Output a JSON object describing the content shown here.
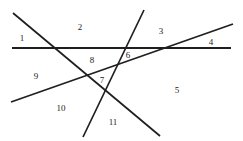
{
  "figure": {
    "width": 243,
    "height": 141,
    "background_color": "#ffffff",
    "stroke_color": "#1f1f1f"
  },
  "lines": [
    {
      "name": "horizontal-line",
      "x1": 12,
      "y1": 48,
      "x2": 231,
      "y2": 48,
      "stroke_width": 1.9
    },
    {
      "name": "descending-line",
      "x1": 13,
      "y1": 13,
      "x2": 160,
      "y2": 136,
      "stroke_width": 1.7
    },
    {
      "name": "ascending-line",
      "x1": 11,
      "y1": 102,
      "x2": 233,
      "y2": 24,
      "stroke_width": 1.7
    },
    {
      "name": "steep-line",
      "x1": 144,
      "y1": 10,
      "x2": 83,
      "y2": 137,
      "stroke_width": 1.7
    }
  ],
  "labels": [
    {
      "name": "region-label-1",
      "text": "1",
      "x": 22,
      "y": 38
    },
    {
      "name": "region-label-2",
      "text": "2",
      "x": 80,
      "y": 27
    },
    {
      "name": "region-label-3",
      "text": "3",
      "x": 161,
      "y": 31
    },
    {
      "name": "region-label-4",
      "text": "4",
      "x": 211,
      "y": 42
    },
    {
      "name": "region-label-5",
      "text": "5",
      "x": 177,
      "y": 90
    },
    {
      "name": "region-label-6",
      "text": "6",
      "x": 128,
      "y": 55
    },
    {
      "name": "region-label-7",
      "text": "7",
      "x": 102,
      "y": 80
    },
    {
      "name": "region-label-8",
      "text": "8",
      "x": 92,
      "y": 60
    },
    {
      "name": "region-label-9",
      "text": "9",
      "x": 36,
      "y": 76
    },
    {
      "name": "region-label-10",
      "text": "10",
      "x": 61,
      "y": 108
    },
    {
      "name": "region-label-11",
      "text": "11",
      "x": 113,
      "y": 122
    }
  ]
}
